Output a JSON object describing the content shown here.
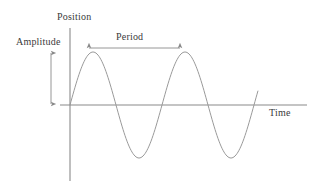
{
  "figure": {
    "background_color": "#ffffff"
  },
  "labels": {
    "y_axis": "Position",
    "x_axis": "Time",
    "amplitude": "Amplitude",
    "period": "Period"
  },
  "colors": {
    "axis": "#8a8a8a",
    "curve": "#9a9a9a",
    "annotation": "#8a8a8a",
    "text": "#3a3a3a"
  },
  "chart_data": {
    "type": "line",
    "title": "",
    "xlabel": "Time",
    "ylabel": "Position",
    "grid": false,
    "legend": null,
    "axes": {
      "origin_x": 70,
      "origin_y": 105,
      "y_axis_top": 28,
      "y_axis_bottom": 181,
      "x_axis_right": 307
    },
    "waveform": {
      "function": "sine",
      "amplitude_px": 53,
      "period_px": 92,
      "phase": 0,
      "start_x": 70,
      "end_x": 258,
      "cycles": 2.04,
      "baseline_y": 105,
      "peak_y": 52,
      "trough_y": 158,
      "peaks_x": [
        93,
        185
      ],
      "troughs_x": [
        139,
        231
      ]
    },
    "annotations": [
      {
        "name": "amplitude",
        "label": "Amplitude",
        "type": "double-arrow-vertical",
        "x": 51,
        "y_from": 52,
        "y_to": 105,
        "measures": "peak displacement from equilibrium"
      },
      {
        "name": "period",
        "label": "Period",
        "type": "double-arrow-horizontal",
        "y": 48,
        "x_from": 88,
        "x_to": 181,
        "measures": "peak-to-peak distance (one full cycle)"
      }
    ]
  }
}
